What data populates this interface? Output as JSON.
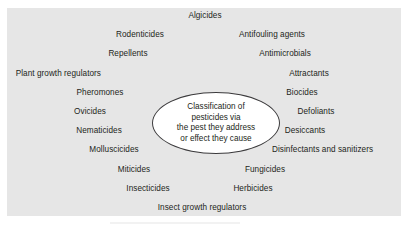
{
  "figure": {
    "type": "concept-cluster-diagram",
    "panel_background": "#e6e6e6",
    "page_background": "#ffffff",
    "text_color": "#231f20",
    "ellipse_stroke": "#3b3a3c",
    "ellipse_fill": "#ffffff"
  },
  "center": {
    "lines": [
      "Classification of",
      "pesticides via",
      "the pest they address",
      "or effect they cause"
    ]
  },
  "nodes": [
    {
      "label": "Algicides",
      "x": 205,
      "y": 16,
      "anchor": "center"
    },
    {
      "label": "Rodenticides",
      "x": 140,
      "y": 35,
      "anchor": "center"
    },
    {
      "label": "Antifouling agents",
      "x": 272,
      "y": 35,
      "anchor": "center"
    },
    {
      "label": "Repellents",
      "x": 128,
      "y": 54,
      "anchor": "center"
    },
    {
      "label": "Antimicrobials",
      "x": 285,
      "y": 54,
      "anchor": "center"
    },
    {
      "label": "Plant growth regulators",
      "x": 101,
      "y": 74,
      "anchor": "right"
    },
    {
      "label": "Attractants",
      "x": 309,
      "y": 74,
      "anchor": "center"
    },
    {
      "label": "Pheromones",
      "x": 100,
      "y": 93,
      "anchor": "center"
    },
    {
      "label": "Biocides",
      "x": 302,
      "y": 93,
      "anchor": "center"
    },
    {
      "label": "Ovicides",
      "x": 90,
      "y": 112,
      "anchor": "center"
    },
    {
      "label": "Defoliants",
      "x": 316,
      "y": 112,
      "anchor": "center"
    },
    {
      "label": "Nematicides",
      "x": 99,
      "y": 131,
      "anchor": "center"
    },
    {
      "label": "Desiccants",
      "x": 305,
      "y": 131,
      "anchor": "center"
    },
    {
      "label": "Molluscicides",
      "x": 114,
      "y": 150,
      "anchor": "center"
    },
    {
      "label": "Disinfectants and sanitizers",
      "x": 272,
      "y": 150,
      "anchor": "left"
    },
    {
      "label": "Miticides",
      "x": 134,
      "y": 170,
      "anchor": "center"
    },
    {
      "label": "Fungicides",
      "x": 265,
      "y": 170,
      "anchor": "center"
    },
    {
      "label": "Insecticides",
      "x": 148,
      "y": 189,
      "anchor": "center"
    },
    {
      "label": "Herbicides",
      "x": 253,
      "y": 189,
      "anchor": "center"
    },
    {
      "label": "Insect growth regulators",
      "x": 202,
      "y": 208,
      "anchor": "center"
    }
  ]
}
